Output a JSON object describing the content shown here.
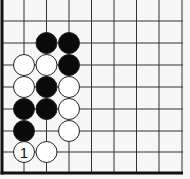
{
  "diagram": {
    "type": "go-board-fragment",
    "board_edges_shown": [
      "left",
      "bottom"
    ],
    "grid": {
      "columns": 9,
      "rows": 8,
      "col_x": [
        2,
        24,
        46.5,
        69,
        91.5,
        114,
        136.5,
        159,
        182
      ],
      "row_y": [
        21,
        43,
        65,
        87,
        109,
        131,
        152,
        173
      ],
      "line_color": "#333333",
      "edge_color": "#111111"
    },
    "stones": [
      {
        "color": "black",
        "col": 2,
        "row": 1,
        "label": ""
      },
      {
        "color": "black",
        "col": 3,
        "row": 1,
        "label": ""
      },
      {
        "color": "white",
        "col": 1,
        "row": 2,
        "label": ""
      },
      {
        "color": "white",
        "col": 2,
        "row": 2,
        "label": ""
      },
      {
        "color": "black",
        "col": 3,
        "row": 2,
        "label": ""
      },
      {
        "color": "white",
        "col": 1,
        "row": 3,
        "label": ""
      },
      {
        "color": "black",
        "col": 2,
        "row": 3,
        "label": ""
      },
      {
        "color": "white",
        "col": 3,
        "row": 3,
        "label": ""
      },
      {
        "color": "black",
        "col": 1,
        "row": 4,
        "label": ""
      },
      {
        "color": "black",
        "col": 2,
        "row": 4,
        "label": ""
      },
      {
        "color": "white",
        "col": 3,
        "row": 4,
        "label": ""
      },
      {
        "color": "black",
        "col": 1,
        "row": 5,
        "label": ""
      },
      {
        "color": "white",
        "col": 3,
        "row": 5,
        "label": ""
      },
      {
        "color": "white",
        "col": 1,
        "row": 6,
        "label": "1"
      },
      {
        "color": "white",
        "col": 2,
        "row": 6,
        "label": ""
      }
    ],
    "colors": {
      "background": "#f7f7f7",
      "black_stone": "#0a0a0a",
      "white_stone": "#ffffff",
      "stone_outline": "#222222"
    }
  }
}
